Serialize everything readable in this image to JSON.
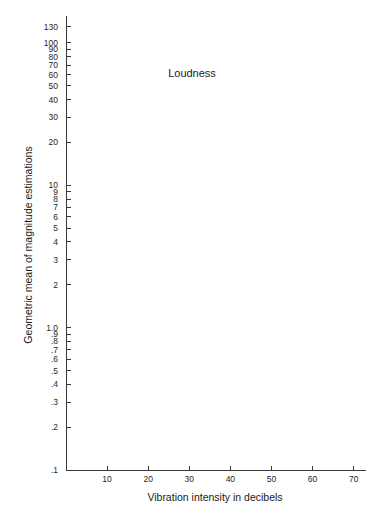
{
  "chart_data": {
    "type": "scatter",
    "title": "Loudness",
    "xlabel": "Vibration intensity in decibels",
    "ylabel": "Geometric mean of magnitude estimations",
    "xscale": "linear",
    "yscale": "log",
    "xlim": [
      0,
      73
    ],
    "ylim": [
      0.1,
      145
    ],
    "grid": false,
    "legend_position": "inside lower-right",
    "xticks": [
      10,
      20,
      30,
      40,
      50,
      60,
      70
    ],
    "xticklabels": [
      "10",
      "20",
      "30",
      "40",
      "50",
      "60",
      "70"
    ],
    "yticks": [
      0.1,
      0.2,
      0.3,
      0.4,
      0.5,
      0.6,
      0.7,
      0.8,
      0.9,
      1.0,
      2,
      3,
      4,
      5,
      6,
      7,
      8,
      9,
      10,
      20,
      30,
      40,
      50,
      60,
      70,
      80,
      90,
      100,
      130
    ],
    "yticklabels": [
      ".1",
      ".2",
      ".3",
      ".4",
      ".5",
      ".6",
      ".7",
      ".8",
      ".9",
      "1.0",
      "2",
      "3",
      "4",
      "5",
      "6",
      "7",
      "8",
      "9",
      "10",
      "20",
      "30",
      "40",
      "50",
      "60",
      "70",
      "80",
      "90",
      "100",
      "130"
    ],
    "series": [
      {
        "name": "Normal observers",
        "marker": "open-circle",
        "color": "#2a2a2a",
        "points": [
          {
            "x": 0,
            "y": 0.5
          },
          {
            "x": 10,
            "y": 1.2
          },
          {
            "x": 20,
            "y": 2.7
          },
          {
            "x": 30,
            "y": 5.2
          },
          {
            "x": 40,
            "y": 11.0
          },
          {
            "x": 50,
            "y": 19.5
          },
          {
            "x": 60.5,
            "y": 36.5
          },
          {
            "x": 70.5,
            "y": 70.0
          }
        ]
      },
      {
        "name": "Patients",
        "marker": "filled-circle",
        "color": "#111111",
        "points": [
          {
            "x": 0,
            "y": 1.0
          },
          {
            "x": 10,
            "y": 2.15
          },
          {
            "x": 20,
            "y": 4.1
          },
          {
            "x": 30,
            "y": 8.6
          },
          {
            "x": 40,
            "y": 15.5
          },
          {
            "x": 50,
            "y": 30.5
          },
          {
            "x": 60.5,
            "y": 63.0
          },
          {
            "x": 70.5,
            "y": 125.0
          }
        ]
      }
    ],
    "legend": [
      {
        "label": "Normal observers",
        "marker": "open-circle"
      },
      {
        "label": "Patients",
        "marker": "filled-circle"
      }
    ]
  }
}
